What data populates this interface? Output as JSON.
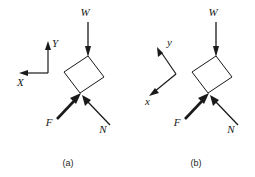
{
  "figure": {
    "background_color": "#ffffff",
    "line_color": "#1a1a1a",
    "width": 255,
    "height": 177,
    "panels": [
      {
        "id": "a",
        "caption": "(a)",
        "caption_pos": {
          "x": 68,
          "y": 166
        },
        "axes": {
          "type": "horizontal-vertical",
          "origin": {
            "x": 48,
            "y": 73
          },
          "vertical_axis": {
            "label": "Y",
            "label_pos": {
              "x": 52,
              "y": 47
            },
            "from": {
              "x": 48,
              "y": 73
            },
            "to": {
              "x": 48,
              "y": 42
            }
          },
          "horizontal_axis": {
            "label": "X",
            "label_pos": {
              "x": 17,
              "y": 86
            },
            "from": {
              "x": 48,
              "y": 73
            },
            "to": {
              "x": 19,
              "y": 73
            }
          }
        },
        "block": {
          "name": "block",
          "points": "88,56 104,77 80,93 64,72"
        },
        "forces": [
          {
            "name": "weight",
            "label": "W",
            "label_pos": {
              "x": 85,
              "y": 16
            },
            "from": {
              "x": 88,
              "y": 22
            },
            "to": {
              "x": 88,
              "y": 56
            },
            "weight": "normal"
          },
          {
            "name": "friction",
            "label": "F",
            "label_pos": {
              "x": 49,
              "y": 125
            },
            "from": {
              "x": 57,
              "y": 119
            },
            "to": {
              "x": 80,
              "y": 94
            },
            "weight": "bold"
          },
          {
            "name": "normal",
            "label": "N",
            "label_pos": {
              "x": 101,
              "y": 132
            },
            "from": {
              "x": 110,
              "y": 125
            },
            "to": {
              "x": 81,
              "y": 94
            },
            "weight": "normal"
          }
        ]
      },
      {
        "id": "b",
        "caption": "(b)",
        "caption_pos": {
          "x": 196,
          "y": 166
        },
        "axes": {
          "type": "rotated",
          "origin": {
            "x": 176,
            "y": 74
          },
          "vertical_axis": {
            "label": "y",
            "label_pos": {
              "x": 168,
              "y": 45
            },
            "from": {
              "x": 176,
              "y": 74
            },
            "to": {
              "x": 158,
              "y": 48
            }
          },
          "horizontal_axis": {
            "label": "x",
            "label_pos": {
              "x": 146,
              "y": 104
            },
            "from": {
              "x": 176,
              "y": 74
            },
            "to": {
              "x": 150,
              "y": 95
            }
          }
        },
        "block": {
          "name": "block",
          "points": "216,56 232,77 208,93 192,72"
        },
        "forces": [
          {
            "name": "weight",
            "label": "W",
            "label_pos": {
              "x": 213,
              "y": 16
            },
            "from": {
              "x": 216,
              "y": 22
            },
            "to": {
              "x": 216,
              "y": 56
            },
            "weight": "normal"
          },
          {
            "name": "friction",
            "label": "F",
            "label_pos": {
              "x": 177,
              "y": 125
            },
            "from": {
              "x": 185,
              "y": 119
            },
            "to": {
              "x": 208,
              "y": 94
            },
            "weight": "bold"
          },
          {
            "name": "normal",
            "label": "N",
            "label_pos": {
              "x": 229,
              "y": 132
            },
            "from": {
              "x": 238,
              "y": 125
            },
            "to": {
              "x": 209,
              "y": 94
            },
            "weight": "normal"
          }
        ]
      }
    ]
  }
}
